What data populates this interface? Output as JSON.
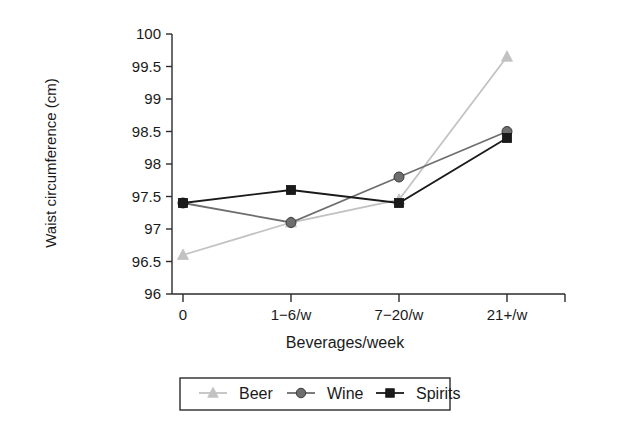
{
  "chart_data": {
    "type": "line",
    "title": "",
    "xlabel": "Beverages/week",
    "ylabel": "Waist circumference (cm)",
    "categories": [
      "0",
      "1−6/w",
      "7−20/w",
      "21+/w"
    ],
    "ylim": [
      96,
      100
    ],
    "yticks": [
      "96",
      "96.5",
      "97",
      "97.5",
      "98",
      "98.5",
      "99",
      "99.5",
      "100"
    ],
    "ytick_values": [
      96,
      96.5,
      97,
      97.5,
      98,
      98.5,
      99,
      99.5,
      100
    ],
    "grid": false,
    "legend_position": "bottom",
    "series": [
      {
        "name": "Beer",
        "marker": "triangle",
        "color": "#c2c2c2",
        "values": [
          96.6,
          97.1,
          97.45,
          99.65
        ]
      },
      {
        "name": "Wine",
        "marker": "circle",
        "color": "#6e6e6e",
        "values": [
          97.4,
          97.1,
          97.8,
          98.5
        ]
      },
      {
        "name": "Spirits",
        "marker": "square",
        "color": "#1a1a1a",
        "values": [
          97.4,
          97.6,
          97.4,
          98.4
        ]
      }
    ]
  },
  "legend": {
    "items": [
      {
        "label": "Beer"
      },
      {
        "label": "Wine"
      },
      {
        "label": "Spirits"
      }
    ]
  },
  "axes": {
    "y_title": "Waist circumference (cm)",
    "x_title": "Beverages/week"
  }
}
